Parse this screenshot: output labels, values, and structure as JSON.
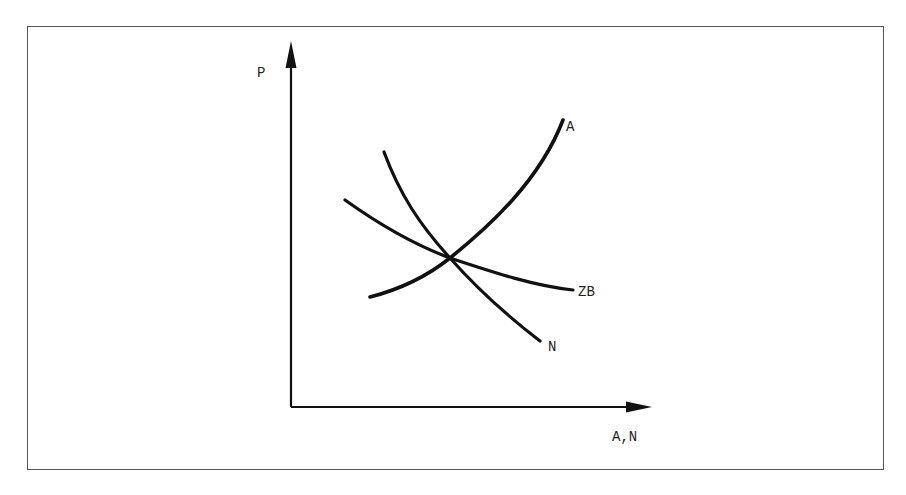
{
  "diagram": {
    "y_axis_label": "P",
    "x_axis_label": "A,N",
    "curves": [
      {
        "name": "A",
        "label": "A",
        "shape": "upward convex-increasing",
        "from": [
          370,
          297
        ],
        "to": [
          563,
          120
        ]
      },
      {
        "name": "N",
        "label": "N",
        "shape": "downward decreasing (steep)",
        "from": [
          384,
          152
        ],
        "to": [
          540,
          341
        ]
      },
      {
        "name": "ZB",
        "label": "ZB",
        "shape": "downward decreasing (flat)",
        "from": [
          345,
          200
        ],
        "to": [
          573,
          290
        ]
      }
    ],
    "intersection": [
      450,
      258
    ],
    "colors": {
      "curve": "#111111",
      "axis": "#111111",
      "frame": "#555555",
      "text": "#222222"
    }
  }
}
